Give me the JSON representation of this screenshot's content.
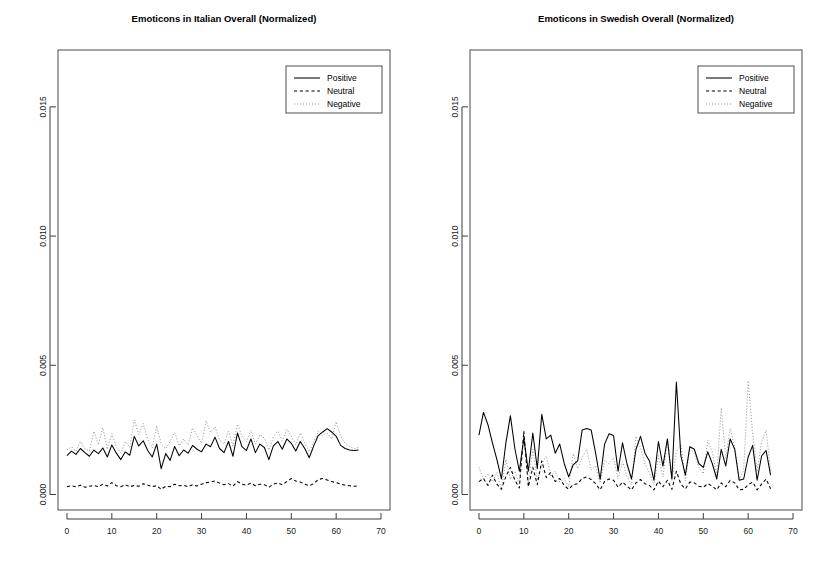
{
  "figure": {
    "background": "#ffffff",
    "width": 823,
    "height": 574,
    "panel_count": 2
  },
  "chart_data": [
    {
      "type": "line",
      "title": "Emoticons in Italian Overall (Normalized)",
      "xlabel": "",
      "ylabel": "",
      "grid": false,
      "legend_position": "top-right",
      "xlim": [
        -2,
        72
      ],
      "ylim": [
        -0.0006,
        0.0172
      ],
      "xticks": [
        0,
        10,
        20,
        30,
        40,
        50,
        60,
        70
      ],
      "xtick_labels": [
        "0",
        "10",
        "20",
        "30",
        "40",
        "50",
        "60",
        "70"
      ],
      "yticks": [
        0.0,
        0.005,
        0.01,
        0.015
      ],
      "ytick_labels": [
        "0.000",
        "0.005",
        "0.010",
        "0.015"
      ],
      "x": [
        0,
        1,
        2,
        3,
        4,
        5,
        6,
        7,
        8,
        9,
        10,
        11,
        12,
        13,
        14,
        15,
        16,
        17,
        18,
        19,
        20,
        21,
        22,
        23,
        24,
        25,
        26,
        27,
        28,
        29,
        30,
        31,
        32,
        33,
        34,
        35,
        36,
        37,
        38,
        39,
        40,
        41,
        42,
        43,
        44,
        45,
        46,
        47,
        48,
        49,
        50,
        51,
        52,
        53,
        54,
        55,
        56,
        57,
        58,
        59,
        60,
        61,
        62,
        63,
        64,
        65
      ],
      "series": [
        {
          "name": "Positive",
          "style": "solid",
          "color": "#000000",
          "values": [
            0.0015,
            0.00168,
            0.00155,
            0.00178,
            0.00162,
            0.00148,
            0.00172,
            0.00158,
            0.0018,
            0.00145,
            0.00192,
            0.0016,
            0.00135,
            0.00165,
            0.00152,
            0.00225,
            0.00188,
            0.00208,
            0.0017,
            0.00145,
            0.00195,
            0.001,
            0.00158,
            0.00132,
            0.00186,
            0.0015,
            0.00172,
            0.0016,
            0.0019,
            0.00175,
            0.00165,
            0.00195,
            0.00185,
            0.00222,
            0.00178,
            0.00162,
            0.00205,
            0.00148,
            0.00238,
            0.00185,
            0.0017,
            0.00215,
            0.00162,
            0.00195,
            0.00182,
            0.00135,
            0.00188,
            0.00205,
            0.00175,
            0.00215,
            0.00198,
            0.00168,
            0.00205,
            0.00178,
            0.00142,
            0.00188,
            0.00228,
            0.00242,
            0.00255,
            0.00242,
            0.00225,
            0.0019,
            0.00178,
            0.00172,
            0.0017,
            0.00172
          ]
        },
        {
          "name": "Neutral",
          "style": "dashed",
          "color": "#000000",
          "values": [
            0.0003,
            0.00034,
            0.0003,
            0.00036,
            0.00028,
            0.00032,
            0.00035,
            0.0003,
            0.0004,
            0.00033,
            0.00046,
            0.00034,
            0.0003,
            0.00038,
            0.0003,
            0.00035,
            0.00032,
            0.00042,
            0.00036,
            0.0003,
            0.00034,
            0.0002,
            0.00032,
            0.0003,
            0.0004,
            0.00034,
            0.00036,
            0.0003,
            0.00038,
            0.00033,
            0.0004,
            0.00046,
            0.00048,
            0.00052,
            0.00044,
            0.00038,
            0.00042,
            0.00032,
            0.0005,
            0.0004,
            0.00036,
            0.00044,
            0.00034,
            0.0004,
            0.00038,
            0.00028,
            0.0004,
            0.00045,
            0.00038,
            0.0005,
            0.00062,
            0.00052,
            0.00048,
            0.0004,
            0.00034,
            0.00042,
            0.00058,
            0.00062,
            0.00056,
            0.0005,
            0.00046,
            0.0004,
            0.00036,
            0.00034,
            0.00032,
            0.00034
          ]
        },
        {
          "name": "Negative",
          "style": "dotted",
          "color": "#9a9a9a",
          "values": [
            0.00172,
            0.00185,
            0.00168,
            0.00205,
            0.00178,
            0.00168,
            0.00245,
            0.00192,
            0.00258,
            0.00175,
            0.00235,
            0.00185,
            0.0016,
            0.00205,
            0.00182,
            0.00288,
            0.00232,
            0.00275,
            0.00212,
            0.0018,
            0.00265,
            0.00195,
            0.00178,
            0.00205,
            0.0024,
            0.00188,
            0.00215,
            0.00192,
            0.00258,
            0.00228,
            0.00198,
            0.00285,
            0.0024,
            0.00262,
            0.00212,
            0.00195,
            0.00245,
            0.00188,
            0.00272,
            0.00226,
            0.00205,
            0.00248,
            0.00195,
            0.00232,
            0.00218,
            0.00172,
            0.00222,
            0.00245,
            0.00208,
            0.00252,
            0.00226,
            0.00192,
            0.00238,
            0.00198,
            0.00165,
            0.00205,
            0.00245,
            0.00226,
            0.00238,
            0.00215,
            0.00282,
            0.00225,
            0.00198,
            0.00185,
            0.00178,
            0.00182
          ]
        }
      ]
    },
    {
      "type": "line",
      "title": "Emoticons in Swedish Overall (Normalized)",
      "xlabel": "",
      "ylabel": "",
      "grid": false,
      "legend_position": "top-right",
      "xlim": [
        -2,
        72
      ],
      "ylim": [
        -0.0006,
        0.0172
      ],
      "xticks": [
        0,
        10,
        20,
        30,
        40,
        50,
        60,
        70
      ],
      "xtick_labels": [
        "0",
        "10",
        "20",
        "30",
        "40",
        "50",
        "60",
        "70"
      ],
      "yticks": [
        0.0,
        0.005,
        0.01,
        0.015
      ],
      "ytick_labels": [
        "0.000",
        "0.005",
        "0.010",
        "0.015"
      ],
      "x": [
        0,
        1,
        2,
        3,
        4,
        5,
        6,
        7,
        8,
        9,
        10,
        11,
        12,
        13,
        14,
        15,
        16,
        17,
        18,
        19,
        20,
        21,
        22,
        23,
        24,
        25,
        26,
        27,
        28,
        29,
        30,
        31,
        32,
        33,
        34,
        35,
        36,
        37,
        38,
        39,
        40,
        41,
        42,
        43,
        44,
        45,
        46,
        47,
        48,
        49,
        50,
        51,
        52,
        53,
        54,
        55,
        56,
        57,
        58,
        59,
        60,
        61,
        62,
        63,
        64,
        65
      ],
      "series": [
        {
          "name": "Positive",
          "style": "solid",
          "color": "#000000",
          "values": [
            0.0023,
            0.00318,
            0.0027,
            0.002,
            0.00135,
            0.0006,
            0.002,
            0.00305,
            0.00178,
            0.0009,
            0.00218,
            0.0009,
            0.00238,
            0.001,
            0.0031,
            0.00215,
            0.0023,
            0.0016,
            0.00195,
            0.0012,
            0.00068,
            0.00115,
            0.0013,
            0.0025,
            0.00255,
            0.0025,
            0.0016,
            0.00058,
            0.00195,
            0.00235,
            0.00228,
            0.0009,
            0.002,
            0.00118,
            0.0006,
            0.00175,
            0.00225,
            0.0016,
            0.0013,
            0.00055,
            0.00205,
            0.0011,
            0.00215,
            0.0006,
            0.00435,
            0.0015,
            0.00075,
            0.00185,
            0.00175,
            0.0012,
            0.00105,
            0.00165,
            0.0012,
            0.0006,
            0.00175,
            0.0011,
            0.00215,
            0.00175,
            0.00055,
            0.0006,
            0.00145,
            0.0019,
            0.00055,
            0.0015,
            0.0017,
            0.00075
          ]
        },
        {
          "name": "Neutral",
          "style": "dashed",
          "color": "#000000",
          "values": [
            0.0005,
            0.00062,
            0.00035,
            0.00075,
            0.0004,
            0.0002,
            0.0007,
            0.00105,
            0.00055,
            0.00025,
            0.00245,
            0.0003,
            0.00105,
            0.00038,
            0.0013,
            0.00065,
            0.00085,
            0.0005,
            0.00062,
            0.00035,
            0.0002,
            0.00038,
            0.00042,
            0.00062,
            0.00068,
            0.00058,
            0.00042,
            0.00018,
            0.0005,
            0.0006,
            0.00055,
            0.00028,
            0.00048,
            0.00032,
            0.00018,
            0.00045,
            0.00058,
            0.00042,
            0.00035,
            0.00018,
            0.00052,
            0.0003,
            0.00055,
            0.0002,
            0.0009,
            0.0004,
            0.00022,
            0.00048,
            0.00045,
            0.00032,
            0.00028,
            0.00042,
            0.00032,
            0.00018,
            0.00045,
            0.0003,
            0.00055,
            0.00045,
            0.00018,
            0.0002,
            0.00038,
            0.00048,
            0.00018,
            0.0004,
            0.0006,
            0.00022
          ]
        },
        {
          "name": "Negative",
          "style": "dotted",
          "color": "#9a9a9a",
          "values": [
            0.00105,
            0.0006,
            0.00082,
            0.0005,
            0.00085,
            0.0002,
            0.00135,
            0.00058,
            0.0009,
            0.0004,
            0.00242,
            0.00045,
            0.00175,
            0.00055,
            0.0012,
            0.0015,
            0.00072,
            0.0009,
            0.00048,
            0.00062,
            0.0003,
            0.00158,
            0.001,
            0.00145,
            0.00175,
            0.00095,
            0.0011,
            0.00045,
            0.00132,
            0.00118,
            0.00142,
            0.0006,
            0.00128,
            0.0007,
            0.00038,
            0.00225,
            0.0018,
            0.0012,
            0.00082,
            0.00035,
            0.0015,
            0.00068,
            0.0021,
            0.00055,
            0.00165,
            0.00195,
            0.00052,
            0.00178,
            0.00158,
            0.00105,
            0.0008,
            0.0021,
            0.00165,
            0.00075,
            0.00335,
            0.0014,
            0.00255,
            0.00185,
            0.0006,
            0.00095,
            0.0044,
            0.00238,
            0.0009,
            0.00205,
            0.00248,
            0.0009
          ]
        }
      ]
    }
  ]
}
